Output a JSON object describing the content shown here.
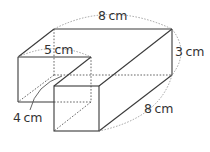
{
  "diagram": {
    "labels": {
      "top_length": "8 cm",
      "inner_width": "5 cm",
      "height": "3 cm",
      "front_length": "8 cm",
      "left_depth": "4 cm"
    }
  }
}
